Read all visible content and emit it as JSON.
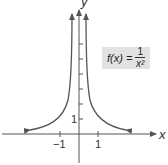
{
  "diagram": {
    "axes": {
      "x_label": "x",
      "y_label": "y"
    },
    "ticks": {
      "x_neg": "−1",
      "x_pos": "1",
      "y_pos": "1"
    },
    "formula": {
      "lhs": "f(x) =",
      "numerator": "1",
      "denominator": "x²"
    },
    "colors": {
      "curve": "#555555",
      "axis": "#555555",
      "box": "#e2e2e2"
    }
  }
}
